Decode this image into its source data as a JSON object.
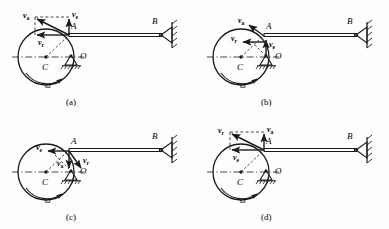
{
  "figure": {
    "type": "mechanics-velocity-diagram",
    "stroke_color": "#1a1a1a",
    "background": "#fefefe",
    "panels": [
      {
        "id": "a",
        "caption": "(a)",
        "points": {
          "A": "A",
          "B": "B",
          "C": "C",
          "O": "O"
        },
        "angular_velocity": "ω",
        "vectors": [
          {
            "name": "v_a",
            "label": "v",
            "sub": "a",
            "dir": "up-left",
            "desc": "absolute velocity, diagonal up-left from A"
          },
          {
            "name": "v_e",
            "label": "v",
            "sub": "e",
            "dir": "up",
            "desc": "transport velocity, vertical up at A"
          },
          {
            "name": "v_r",
            "label": "v",
            "sub": "r",
            "dir": "left",
            "desc": "relative velocity, horizontal left from A"
          }
        ]
      },
      {
        "id": "b",
        "caption": "(b)",
        "points": {
          "A": "A",
          "B": "B",
          "C": "C",
          "O": "O"
        },
        "angular_velocity": "ω",
        "vectors": [
          {
            "name": "v_a",
            "label": "v",
            "sub": "a",
            "dir": "up-left",
            "desc": "absolute velocity, diagonal up-left from A"
          },
          {
            "name": "v_r",
            "label": "v",
            "sub": "r",
            "dir": "left",
            "desc": "relative velocity, horizontal left at A"
          },
          {
            "name": "v_e",
            "label": "v",
            "sub": "e",
            "dir": "up",
            "desc": "transport velocity, vertical up from O to A"
          }
        ]
      },
      {
        "id": "c",
        "caption": "(c)",
        "points": {
          "A": "A",
          "B": "B",
          "C": "C",
          "O": "O"
        },
        "angular_velocity": "ω",
        "vectors": [
          {
            "name": "v_e",
            "label": "v",
            "sub": "e",
            "dir": "left",
            "desc": "transport velocity, horizontal left at A"
          },
          {
            "name": "v_a",
            "label": "v",
            "sub": "a",
            "dir": "down",
            "desc": "absolute velocity, vertical down from A"
          },
          {
            "name": "v_r",
            "label": "v",
            "sub": "r",
            "dir": "down-right",
            "desc": "relative velocity, diagonal down-right from A"
          }
        ]
      },
      {
        "id": "d",
        "caption": "(d)",
        "points": {
          "A": "A",
          "B": "B",
          "C": "C",
          "O": "O"
        },
        "angular_velocity": "ω",
        "vectors": [
          {
            "name": "v_r",
            "label": "v",
            "sub": "r",
            "dir": "up-left",
            "desc": "relative velocity, diagonal up-left from A"
          },
          {
            "name": "v_a",
            "label": "v",
            "sub": "a",
            "dir": "up",
            "desc": "absolute velocity, vertical up at A"
          },
          {
            "name": "v_e",
            "label": "v",
            "sub": "e",
            "dir": "left",
            "desc": "transport velocity, horizontal left from A"
          }
        ]
      }
    ]
  }
}
